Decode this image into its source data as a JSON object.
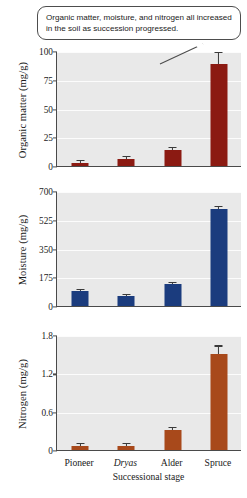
{
  "annotation": {
    "text": "Organic matter, moisture, and nitrogen all increased in the soil as succession progressed."
  },
  "axis": {
    "xlabel": "Successional stage",
    "categories": [
      "Pioneer",
      "Dryas",
      "Alder",
      "Spruce"
    ]
  },
  "colors": {
    "organic_matter_bar": "#8B1A12",
    "moisture_bar": "#1B3C7E",
    "nitrogen_bar": "#A8491B",
    "plot_background": "#e9e9e9",
    "gridline": "#fcfcfc",
    "axis_line": "#4a4a4a",
    "error_bar": "#3a3a3a",
    "callout_border": "#4d4d4d"
  },
  "chart_data": [
    {
      "type": "bar",
      "id": "organic-matter",
      "title": "",
      "xlabel": "Successional stage",
      "ylabel": "Organic matter (mg/g)",
      "categories": [
        "Pioneer",
        "Dryas",
        "Alder",
        "Spruce"
      ],
      "values": [
        3,
        6,
        14,
        89
      ],
      "errors": [
        1.2,
        1.5,
        1.8,
        9
      ],
      "ylim": [
        0,
        100
      ],
      "yticks": [
        0,
        25,
        50,
        75,
        100
      ],
      "ytick_labels": [
        "0",
        "25",
        "50",
        "75",
        "100"
      ],
      "grid": true,
      "legend": "none",
      "bar_color": "#8B1A12"
    },
    {
      "type": "bar",
      "id": "moisture",
      "title": "",
      "xlabel": "Successional stage",
      "ylabel": "Moisture (mg/g)",
      "categories": [
        "Pioneer",
        "Dryas",
        "Alder",
        "Spruce"
      ],
      "values": [
        90,
        60,
        132,
        590
      ],
      "errors": [
        8,
        8,
        8,
        14
      ],
      "ylim": [
        0,
        700
      ],
      "yticks": [
        0,
        175,
        350,
        525,
        700
      ],
      "ytick_labels": [
        "0",
        "175",
        "350",
        "525",
        "700"
      ],
      "grid": true,
      "legend": "none",
      "bar_color": "#1B3C7E"
    },
    {
      "type": "bar",
      "id": "nitrogen",
      "title": "",
      "xlabel": "Successional stage",
      "ylabel": "Nitrogen (mg/g)",
      "categories": [
        "Pioneer",
        "Dryas",
        "Alder",
        "Spruce"
      ],
      "values": [
        0.07,
        0.07,
        0.32,
        1.5
      ],
      "errors": [
        0.03,
        0.03,
        0.02,
        0.12
      ],
      "ylim": [
        0,
        1.8
      ],
      "yticks": [
        0,
        0.6,
        1.2,
        1.8
      ],
      "ytick_labels": [
        "0",
        "0.6",
        "1.2",
        "1.8"
      ],
      "grid": true,
      "legend": "none",
      "bar_color": "#A8491B"
    }
  ]
}
